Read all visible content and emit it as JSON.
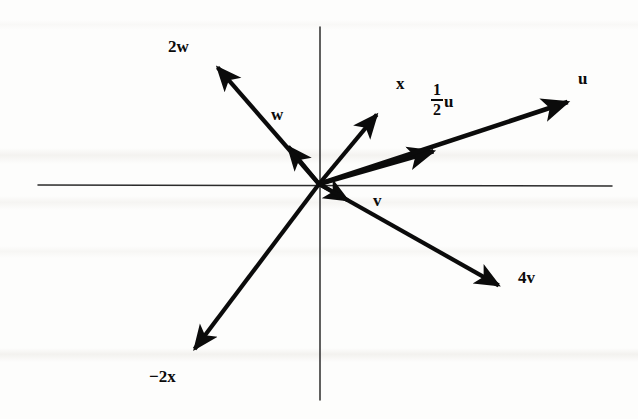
{
  "figure": {
    "type": "vector-diagram",
    "background_color": "#fdfdfc",
    "ink_color": "#0b0b0b",
    "axis_color": "#2b2b2b"
  },
  "axes": {
    "origin": {
      "x": 319,
      "y": 184
    },
    "horizontal": {
      "x1": 38,
      "y1": 185,
      "x2": 612,
      "y2": 186,
      "label": ""
    },
    "vertical": {
      "x1": 320,
      "y1": 27,
      "x2": 320,
      "y2": 400,
      "label": ""
    },
    "show_ticks": false,
    "show_grid": false
  },
  "vectors": [
    {
      "id": "w",
      "label": "w",
      "coefficient": "",
      "symbol": "w",
      "tip": {
        "x": 277,
        "y": 133
      },
      "label_pos": {
        "x": 271,
        "y": 106
      },
      "stroke_width": 4.2
    },
    {
      "id": "2w",
      "label": "2w",
      "coefficient": "2",
      "symbol": "w",
      "tip": {
        "x": 206,
        "y": 54
      },
      "label_pos": {
        "x": 168,
        "y": 38
      },
      "stroke_width": 4.2
    },
    {
      "id": "x",
      "label": "x",
      "coefficient": "",
      "symbol": "x",
      "tip": {
        "x": 388,
        "y": 101
      },
      "label_pos": {
        "x": 396,
        "y": 75
      },
      "stroke_width": 4.2
    },
    {
      "id": "-2x",
      "label": "−2x",
      "coefficient": "−2",
      "symbol": "x",
      "tip": {
        "x": 184,
        "y": 363
      },
      "label_pos": {
        "x": 149,
        "y": 368
      },
      "stroke_width": 4.2
    },
    {
      "id": "half-u",
      "label": "1/2 u",
      "coefficient": "1/2",
      "symbol": "u",
      "numerator": "1",
      "denominator": "2",
      "tip": {
        "x": 452,
        "y": 146
      },
      "label_pos": {
        "x": 431,
        "y": 82
      },
      "stroke_width": 4.6
    },
    {
      "id": "u",
      "label": "u",
      "coefficient": "",
      "symbol": "u",
      "tip": {
        "x": 586,
        "y": 96
      },
      "label_pos": {
        "x": 578,
        "y": 70
      },
      "stroke_width": 4.6
    },
    {
      "id": "v",
      "label": "v",
      "coefficient": "",
      "symbol": "v",
      "tip": {
        "x": 363,
        "y": 209
      },
      "label_pos": {
        "x": 373,
        "y": 192
      },
      "stroke_width": 4.2
    },
    {
      "id": "4v",
      "label": "4v",
      "coefficient": "4",
      "symbol": "v",
      "tip": {
        "x": 514,
        "y": 294
      },
      "label_pos": {
        "x": 518,
        "y": 269
      },
      "stroke_width": 4.2
    }
  ]
}
